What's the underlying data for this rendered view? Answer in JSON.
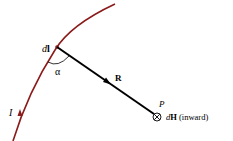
{
  "diagram": {
    "type": "biot-savart-law",
    "labels": {
      "current_element": "dl",
      "current_element_italic": "d",
      "current_element_bold": "l",
      "angle": "α",
      "distance_vector": "R",
      "point": "P",
      "field_italic": "d",
      "field_bold": "H",
      "field_note": "(inward)",
      "current": "I"
    },
    "colors": {
      "wire": "#8b1a1a",
      "vector": "#000000",
      "text": "#000000"
    }
  }
}
